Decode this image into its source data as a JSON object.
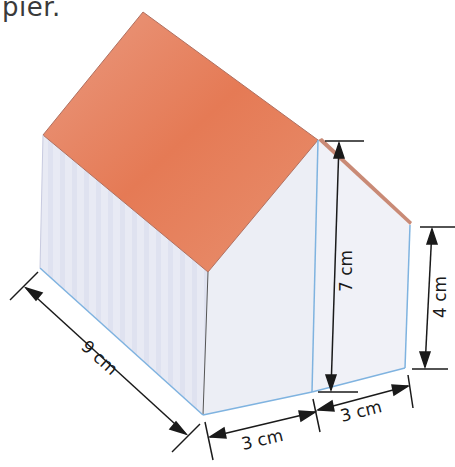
{
  "header": {
    "text": "pier."
  },
  "figure": {
    "colors": {
      "roof": "#e8876a",
      "roof_dark": "#e2602f",
      "wall": "#e9ebf4",
      "wall_side": "#f1f2f7",
      "edge_blue": "#7fb3e0",
      "dim_line": "#1a1a1a"
    },
    "dimensions": {
      "length": "9 cm",
      "height_tall": "7 cm",
      "height_short": "4 cm",
      "width_front": "3 cm",
      "width_back": "3 cm"
    }
  }
}
